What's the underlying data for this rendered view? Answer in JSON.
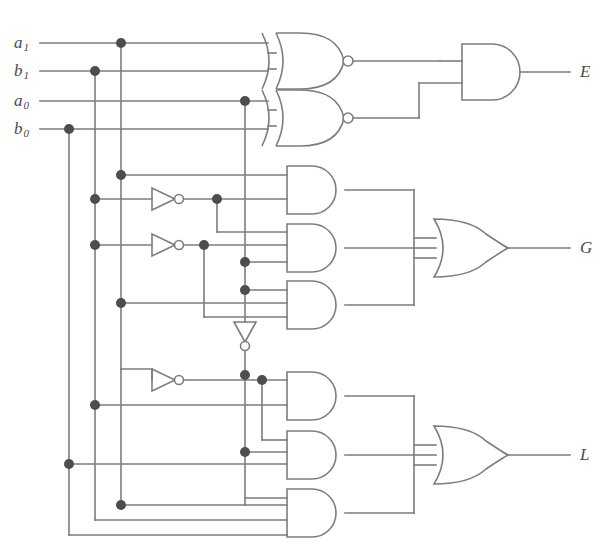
{
  "diagram": {
    "stroke_color": "#7d7d7d",
    "dot_color": "#4d4d4d",
    "text_color": "#4a4a4a",
    "background": "#ffffff",
    "stroke_width": 1.6
  },
  "inputs": [
    {
      "id": "a1",
      "base": "a",
      "subscript": "1",
      "label": "a1",
      "y": 43
    },
    {
      "id": "b1",
      "base": "b",
      "subscript": "1",
      "label": "b1",
      "y": 71
    },
    {
      "id": "a0",
      "base": "a",
      "subscript": "0",
      "label": "a0",
      "y": 101
    },
    {
      "id": "b0",
      "base": "b",
      "subscript": "0",
      "label": "b0",
      "y": 129
    }
  ],
  "outputs": [
    {
      "id": "E",
      "label": "E",
      "meaning": "equal",
      "y": 72
    },
    {
      "id": "G",
      "label": "G",
      "meaning": "greater-than",
      "y": 248
    },
    {
      "id": "L",
      "label": "L",
      "meaning": "less-than",
      "y": 455
    }
  ],
  "gates": [
    {
      "id": "xnor1",
      "type": "xnor",
      "inputs": 2,
      "x": 275,
      "y": 60,
      "name": "xnor-gate-high-bit"
    },
    {
      "id": "xnor2",
      "type": "xnor",
      "inputs": 2,
      "x": 275,
      "y": 118,
      "name": "xnor-gate-low-bit"
    },
    {
      "id": "and_e",
      "type": "and",
      "inputs": 2,
      "x": 460,
      "y": 72,
      "name": "and-gate-equal"
    },
    {
      "id": "and_g1",
      "type": "and",
      "inputs": 2,
      "x": 285,
      "y": 190,
      "name": "and-gate-greater-1"
    },
    {
      "id": "and_g2",
      "type": "and",
      "inputs": 3,
      "x": 285,
      "y": 248,
      "name": "and-gate-greater-2"
    },
    {
      "id": "and_g3",
      "type": "and",
      "inputs": 3,
      "x": 285,
      "y": 305,
      "name": "and-gate-greater-3"
    },
    {
      "id": "or_g",
      "type": "or",
      "inputs": 3,
      "x": 450,
      "y": 248,
      "name": "or-gate-greater"
    },
    {
      "id": "and_l1",
      "type": "and",
      "inputs": 2,
      "x": 285,
      "y": 396,
      "name": "and-gate-less-1"
    },
    {
      "id": "and_l2",
      "type": "and",
      "inputs": 3,
      "x": 285,
      "y": 455,
      "name": "and-gate-less-2"
    },
    {
      "id": "and_l3",
      "type": "and",
      "inputs": 3,
      "x": 285,
      "y": 513,
      "name": "and-gate-less-3"
    },
    {
      "id": "or_l",
      "type": "or",
      "inputs": 3,
      "x": 450,
      "y": 455,
      "name": "or-gate-less"
    },
    {
      "id": "inv1",
      "type": "inverter",
      "orientation": "right",
      "x": 152,
      "y": 199,
      "name": "inverter-1"
    },
    {
      "id": "inv2",
      "type": "inverter",
      "orientation": "right",
      "x": 152,
      "y": 245,
      "name": "inverter-2"
    },
    {
      "id": "inv3",
      "type": "inverter",
      "orientation": "down",
      "x": 245,
      "y": 330,
      "name": "inverter-3"
    },
    {
      "id": "inv4",
      "type": "inverter",
      "orientation": "right",
      "x": 152,
      "y": 380,
      "name": "inverter-4"
    }
  ],
  "junction_count": 18,
  "logic": {
    "E": "(a1 XNOR b1) AND (a0 XNOR b0)",
    "G": "(a1 AND b1') + (a0 AND b0' AND (a1 XNOR b1)) + (a1 AND a0 AND b0')",
    "L": "(a1' AND b1) + (a0' AND b0 AND (a1 XNOR b1)) + (a0' AND b1 AND b0)"
  }
}
